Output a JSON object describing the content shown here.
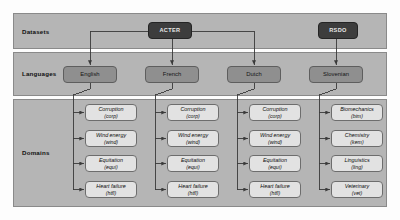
{
  "figure": {
    "rows": [
      {
        "id": "datasets",
        "label": "Datasets"
      },
      {
        "id": "languages",
        "label": "Languages"
      },
      {
        "id": "domains",
        "label": "Domains"
      }
    ]
  },
  "datasets": [
    {
      "id": "acter",
      "label": "ACTER"
    },
    {
      "id": "rsdo",
      "label": "RSDO"
    }
  ],
  "languages": [
    {
      "id": "english",
      "label": "English",
      "dataset": "acter"
    },
    {
      "id": "french",
      "label": "French",
      "dataset": "acter"
    },
    {
      "id": "dutch",
      "label": "Dutch",
      "dataset": "acter"
    },
    {
      "id": "slovenian",
      "label": "Slovenian",
      "dataset": "rsdo"
    }
  ],
  "domains": {
    "english": [
      {
        "name": "Corruption",
        "abbr": "(corp)"
      },
      {
        "name": "Wind energy",
        "abbr": "(wind)"
      },
      {
        "name": "Equitation",
        "abbr": "(equi)"
      },
      {
        "name": "Heart failure",
        "abbr": "(htfl)"
      }
    ],
    "french": [
      {
        "name": "Corruption",
        "abbr": "(corp)"
      },
      {
        "name": "Wind energy",
        "abbr": "(wind)"
      },
      {
        "name": "Equitation",
        "abbr": "(equi)"
      },
      {
        "name": "Heart failure",
        "abbr": "(htfl)"
      }
    ],
    "dutch": [
      {
        "name": "Corruption",
        "abbr": "(corp)"
      },
      {
        "name": "Wind energy",
        "abbr": "(wind)"
      },
      {
        "name": "Equitation",
        "abbr": "(equi)"
      },
      {
        "name": "Heart failure",
        "abbr": "(htfl)"
      }
    ],
    "slovenian": [
      {
        "name": "Biomechanics",
        "abbr": "(bim)"
      },
      {
        "name": "Chemistry",
        "abbr": "(kem)"
      },
      {
        "name": "Linguistics",
        "abbr": "(ling)"
      },
      {
        "name": "Veterinary",
        "abbr": "(vet)"
      }
    ]
  },
  "colors": {
    "band_fill": "#b5b5b5",
    "band_stroke": "#8a8a8a",
    "dataset_fill": "#3d3d3d",
    "dataset_text": "#e8e8e8",
    "language_fill": "#8f8f8f",
    "domain_fill": "#e2e2e2",
    "connector": "#3a3a3a",
    "page_background": "#fdfdfd"
  }
}
